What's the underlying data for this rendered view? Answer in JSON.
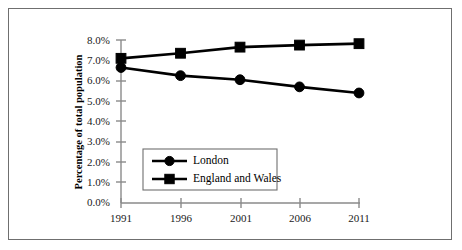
{
  "chart_data": {
    "type": "line",
    "title": "",
    "subtitle": "",
    "xlabel": "",
    "ylabel": "Percentage of total population",
    "categories": [
      "1991",
      "1996",
      "2001",
      "2006",
      "2011"
    ],
    "x": [
      1991,
      1996,
      2001,
      2006,
      2011
    ],
    "xlim": [
      1991,
      2011
    ],
    "ylim": [
      0.0,
      8.0
    ],
    "ytick_labels": [
      "0.0%",
      "1.0%",
      "2.0%",
      "3.0%",
      "4.0%",
      "5.0%",
      "6.0%",
      "7.0%",
      "8.0%"
    ],
    "ytick_values": [
      0.0,
      1.0,
      2.0,
      3.0,
      4.0,
      5.0,
      6.0,
      7.0,
      8.0
    ],
    "xtick_labels": [
      "1991",
      "1996",
      "2001",
      "2006",
      "2011"
    ],
    "grid": false,
    "legend_position": "center-left-inside",
    "series": [
      {
        "name": "London",
        "marker": "circle",
        "color": "#000000",
        "values": [
          6.65,
          6.25,
          6.05,
          5.7,
          5.4
        ]
      },
      {
        "name": "England and Wales",
        "marker": "square",
        "color": "#000000",
        "values": [
          7.1,
          7.35,
          7.65,
          7.75,
          7.82
        ]
      }
    ]
  },
  "axes": {
    "y_title": "Percentage of total population",
    "y_ticks": [
      "8.0%",
      "7.0%",
      "6.0%",
      "5.0%",
      "4.0%",
      "3.0%",
      "2.0%",
      "1.0%",
      "0.0%"
    ],
    "x_ticks": [
      "1991",
      "1996",
      "2001",
      "2006",
      "2011"
    ]
  },
  "legend": {
    "items": [
      {
        "label": "London",
        "marker": "circle"
      },
      {
        "label": "England and Wales",
        "marker": "square"
      }
    ]
  },
  "colors": {
    "series": "#000000",
    "axis": "#8a8a8a",
    "frame": "#6f6f6f",
    "background": "#ffffff",
    "text": "#000000"
  }
}
